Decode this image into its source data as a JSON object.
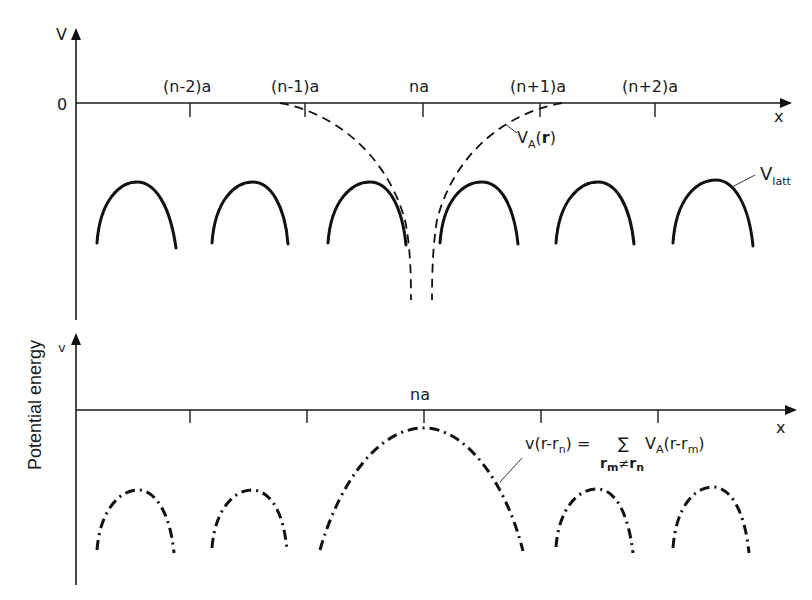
{
  "figure": {
    "y_axis_label": "Potential energy",
    "upper_panel": {
      "y_axis_symbol": "V",
      "zero_label": "0",
      "x_axis_symbol": "x",
      "tick_labels": [
        "(n-2)a",
        "(n-1)a",
        "na",
        "(n+1)a",
        "(n+2)a"
      ],
      "atomic_potential_label": {
        "main": "V",
        "sub": "A",
        "arg_open": "(",
        "arg": "r",
        "arg_close": ")"
      },
      "lattice_potential_label": {
        "main": "V",
        "sub": "latt"
      }
    },
    "lower_panel": {
      "y_axis_symbol": "v",
      "x_axis_symbol": "x",
      "center_tick_label": "na",
      "formula": {
        "lhs": "v(r-r",
        "lhs_sub": "n",
        "lhs_close": ") =",
        "sum": "∑",
        "sum_sub_a": "r",
        "sum_sub_a_sub": "m",
        "sum_neq": "≠",
        "sum_sub_b": "r",
        "sum_sub_b_sub": "n",
        "rhs_main": "V",
        "rhs_sub": "A",
        "rhs_arg": "(r-r",
        "rhs_arg_sub": "m",
        "rhs_close": ")"
      }
    },
    "colors": {
      "ink": "#111111",
      "background": "#ffffff"
    }
  }
}
